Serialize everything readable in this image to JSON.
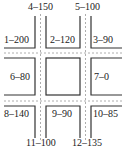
{
  "diagram": {
    "colors": {
      "line": "#333333",
      "dash": "#999999",
      "text": "#222222"
    },
    "segments": {
      "s1": "1–200",
      "s2": "2–120",
      "s3": "3–90",
      "s4": "4–150",
      "s5": "5–100",
      "s6": "6–80",
      "s7": "7–0",
      "s8": "8–140",
      "s9": "9–90",
      "s10": "10–85",
      "s11": "11–100",
      "s12": "12–135"
    }
  }
}
